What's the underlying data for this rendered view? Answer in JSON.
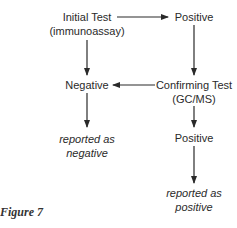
{
  "diagram": {
    "nodes": {
      "initial_test": {
        "line1": "Initial Test",
        "line2": "(immunoassay)"
      },
      "positive_1": {
        "label": "Positive"
      },
      "negative": {
        "label": "Negative"
      },
      "confirming_test": {
        "line1": "Confirming Test",
        "line2": "(GC/MS)"
      },
      "reported_negative": {
        "line1": "reported as",
        "line2": "negative"
      },
      "positive_2": {
        "label": "Positive"
      },
      "reported_positive": {
        "line1": "reported as",
        "line2": "positive"
      }
    },
    "edges": [
      {
        "from": "initial_test",
        "to": "positive_1"
      },
      {
        "from": "initial_test",
        "to": "negative"
      },
      {
        "from": "positive_1",
        "to": "confirming_test"
      },
      {
        "from": "confirming_test",
        "to": "negative"
      },
      {
        "from": "negative",
        "to": "reported_negative"
      },
      {
        "from": "confirming_test",
        "to": "positive_2"
      },
      {
        "from": "positive_2",
        "to": "reported_positive"
      }
    ]
  },
  "caption": "Figure 7",
  "colors": {
    "text": "#2a2a2a",
    "arrow": "#2a2a2a"
  }
}
